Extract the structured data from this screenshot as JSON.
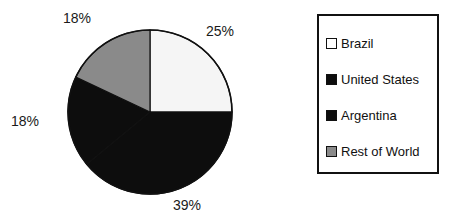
{
  "chart_data": {
    "type": "pie",
    "title": "",
    "labels": [
      "Brazil",
      "United States",
      "Argentina",
      "Rest of World"
    ],
    "values": [
      25,
      39,
      18,
      18
    ],
    "value_labels": [
      "25%",
      "39%",
      "18%",
      "18%"
    ],
    "colors": [
      "#f5f5f5",
      "#0d0d0d",
      "#0d0d0d",
      "#8a8a8a"
    ],
    "start_angle_deg": 0,
    "direction": "clockwise",
    "legend_position": "right",
    "grid": false,
    "units": "percent"
  },
  "pie": {
    "slices": [
      {
        "name": "Brazil",
        "value": 25,
        "label": "25%",
        "color": "#f5f5f5",
        "start_deg": 0,
        "sweep_deg": 90
      },
      {
        "name": "United States",
        "value": 39,
        "label": "39%",
        "color": "#0d0d0d",
        "start_deg": 90,
        "sweep_deg": 140.4
      },
      {
        "name": "Argentina",
        "value": 18,
        "label": "18%",
        "color": "#0d0d0d",
        "start_deg": 230.4,
        "sweep_deg": 64.8
      },
      {
        "name": "Rest of World",
        "value": 18,
        "label": "18%",
        "color": "#8a8a8a",
        "start_deg": 295.2,
        "sweep_deg": 64.8
      }
    ],
    "outline_color": "#111111",
    "labels": {
      "rest_of_world": "18%",
      "brazil": "25%",
      "argentina": "18%",
      "united_states": "39%"
    }
  },
  "legend": {
    "items": [
      {
        "label": "Brazil",
        "swatch": "#ffffff"
      },
      {
        "label": "United States",
        "swatch": "#0d0d0d"
      },
      {
        "label": "Argentina",
        "swatch": "#0d0d0d"
      },
      {
        "label": "Rest of World",
        "swatch": "#8a8a8a"
      }
    ],
    "border_color": "#111111"
  }
}
